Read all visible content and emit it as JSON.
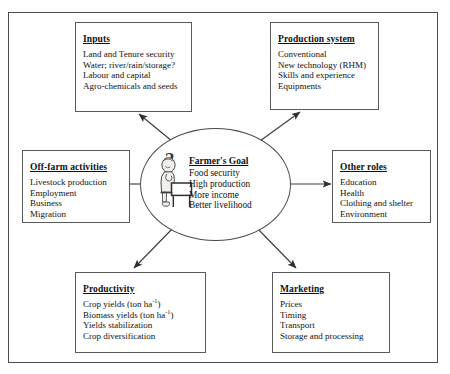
{
  "figure": {
    "top_artifact": "",
    "center": {
      "heading": "Farmer's Goal",
      "items": [
        "Food security",
        "High production",
        "More income",
        "Better livelihood"
      ],
      "icon": "thinking-farmer-icon",
      "question_mark": "?"
    },
    "boxes": [
      {
        "id": "inputs",
        "heading": "Inputs",
        "items": [
          "Land and Tenure security",
          "Water; river/rain/storage?",
          "Labour and capital",
          "Agro-chemicals and seeds"
        ]
      },
      {
        "id": "production",
        "heading": "Production system",
        "items": [
          "Conventional",
          "New technology (RHM)",
          "Skills and experience",
          "Equipments"
        ]
      },
      {
        "id": "offfarm",
        "heading": "Off-farm activities",
        "items": [
          "Livestock production",
          "Employment",
          "Business",
          "Migration"
        ]
      },
      {
        "id": "otherroles",
        "heading": "Other roles",
        "items": [
          "Education",
          "Health",
          "Clothing and shelter",
          "Environment"
        ]
      },
      {
        "id": "productivity",
        "heading": "Productivity",
        "items": [
          "Crop yields (ton ha-1)",
          "Biomass yields (ton ha-1)",
          "Yields stabilization",
          "Crop diversification"
        ],
        "items_html": [
          "Crop yields (ton ha<sup>-1</sup>)",
          "Biomass yields (ton ha<sup>-1</sup>)",
          "Yields stabilization",
          "Crop diversification"
        ]
      },
      {
        "id": "marketing",
        "heading": "Marketing",
        "items": [
          "Prices",
          "Timing",
          "Transport",
          "Storage and processing"
        ]
      }
    ],
    "arrows": [
      {
        "from": "center",
        "to": "inputs",
        "direction": "up-left"
      },
      {
        "from": "center",
        "to": "production",
        "direction": "up-right"
      },
      {
        "from": "center",
        "to": "offfarm",
        "direction": "left"
      },
      {
        "from": "center",
        "to": "otherroles",
        "direction": "right"
      },
      {
        "from": "center",
        "to": "productivity",
        "direction": "down-left"
      },
      {
        "from": "center",
        "to": "marketing",
        "direction": "down-right"
      }
    ],
    "colors": {
      "line": "#4a4a4a",
      "text": "#111111",
      "background": "#ffffff"
    }
  }
}
